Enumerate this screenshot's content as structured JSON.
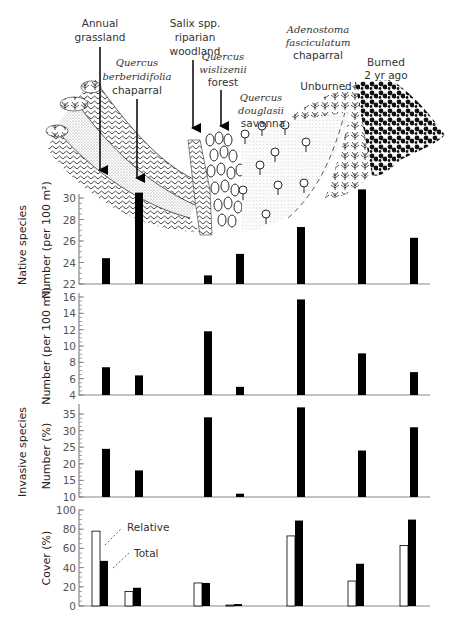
{
  "illustration": {
    "labels": [
      {
        "id": "annual-grassland",
        "lines": [
          "Annual",
          "grassland"
        ],
        "italic": [
          false,
          false
        ],
        "x": 98,
        "y": [
          27,
          41
        ],
        "arrow": {
          "x": 100,
          "y1": 47,
          "y2": 172
        }
      },
      {
        "id": "quercus-berberidifolia",
        "lines": [
          "Quercus",
          "berberidifolia",
          "chaparral"
        ],
        "italic": [
          true,
          true,
          false
        ],
        "x": 137,
        "y": [
          66,
          80,
          94
        ],
        "arrow": {
          "x": 137,
          "y1": 99,
          "y2": 182
        }
      },
      {
        "id": "salix-riparian",
        "lines": [
          "Salix spp.",
          "riparian",
          "woodland"
        ],
        "italic": [
          false,
          false,
          false
        ],
        "x": 195,
        "y": [
          27,
          41,
          55
        ],
        "arrow": {
          "x": 193,
          "y1": 60,
          "y2": 132
        }
      },
      {
        "id": "quercus-wislizenii",
        "lines": [
          "Quercus",
          "wislizenii",
          "forest"
        ],
        "italic": [
          true,
          true,
          false
        ],
        "x": 221,
        "y": [
          60,
          73,
          86
        ],
        "arrow": {
          "x": 221,
          "y1": 90,
          "y2": 130
        }
      },
      {
        "id": "quercus-douglasii",
        "lines": [
          "Quercus",
          "douglasii",
          "savanna"
        ],
        "italic": [
          true,
          true,
          false
        ],
        "x": 258,
        "y": [
          101,
          114,
          127
        ]
      },
      {
        "id": "adenostoma",
        "lines": [
          "Adenostoma",
          "fasciculatum",
          "chaparral"
        ],
        "italic": [
          true,
          true,
          false
        ],
        "x": 318,
        "y": [
          33,
          46,
          59
        ]
      },
      {
        "id": "unburned",
        "lines": [
          "Unburned"
        ],
        "italic": [
          false
        ],
        "x": 326,
        "y": [
          90
        ]
      },
      {
        "id": "burned",
        "lines": [
          "Burned",
          "2 yr ago"
        ],
        "italic": [
          false,
          false
        ],
        "x": 366,
        "y": [
          66,
          79
        ]
      }
    ]
  },
  "side_labels": {
    "native": "Native species",
    "invasive": "Invasive species"
  },
  "chart_data": [
    {
      "type": "bar",
      "group": "Native species",
      "title": "",
      "ylabel": "Number (per 100 m²)",
      "ylim": [
        22,
        31
      ],
      "yticks": [
        22,
        24,
        26,
        28,
        30
      ],
      "categories": [
        "Annual grassland",
        "Quercus berberidifolia chaparral",
        "Salix spp. riparian woodland",
        "Quercus wislizenii forest",
        "Quercus douglasii savanna",
        "Adenostoma fasciculatum chaparral (unburned)",
        "Adenostoma fasciculatum chaparral (burned 2 yr ago)"
      ],
      "values": [
        24.4,
        30.5,
        22.8,
        24.8,
        27.3,
        30.8,
        26.3
      ]
    },
    {
      "type": "bar",
      "group": "Invasive species",
      "title": "",
      "ylabel": "Number (per 100 m²)",
      "ylim": [
        4,
        16.5
      ],
      "yticks": [
        4,
        6,
        8,
        10,
        12,
        14,
        16
      ],
      "categories": [
        "Annual grassland",
        "Quercus berberidifolia chaparral",
        "Salix spp. riparian woodland",
        "Quercus wislizenii forest",
        "Quercus douglasii savanna",
        "Adenostoma fasciculatum chaparral (unburned)",
        "Adenostoma fasciculatum chaparral (burned 2 yr ago)"
      ],
      "values": [
        7.4,
        6.4,
        11.8,
        5.0,
        15.7,
        9.1,
        6.8
      ]
    },
    {
      "type": "bar",
      "group": "Invasive species",
      "title": "",
      "ylabel": "Number (%)",
      "ylim": [
        10,
        37.5
      ],
      "yticks": [
        10,
        15,
        20,
        25,
        30,
        35
      ],
      "categories": [
        "Annual grassland",
        "Quercus berberidifolia chaparral",
        "Salix spp. riparian woodland",
        "Quercus wislizenii forest",
        "Quercus douglasii savanna",
        "Adenostoma fasciculatum chaparral (unburned)",
        "Adenostoma fasciculatum chaparral (burned 2 yr ago)"
      ],
      "values": [
        24.5,
        18.0,
        34.0,
        11.0,
        37.0,
        24.0,
        31.0
      ]
    },
    {
      "type": "bar",
      "group": "Invasive species",
      "title": "",
      "ylabel": "Cover (%)",
      "ylim": [
        0,
        100
      ],
      "yticks": [
        0,
        20,
        40,
        60,
        80,
        100
      ],
      "categories": [
        "Annual grassland",
        "Quercus berberidifolia chaparral",
        "Salix spp. riparian woodland",
        "Quercus wislizenii forest",
        "Quercus douglasii savanna",
        "Adenostoma fasciculatum chaparral (unburned)",
        "Adenostoma fasciculatum chaparral (burned 2 yr ago)"
      ],
      "series": [
        {
          "name": "Relative",
          "fill": "#ffffff",
          "values": [
            78,
            15,
            24,
            1,
            73,
            26,
            63
          ]
        },
        {
          "name": "Total",
          "fill": "#000000",
          "values": [
            47,
            19,
            24,
            2,
            89,
            44,
            90
          ]
        }
      ],
      "annotations": [
        "Relative",
        "Total"
      ]
    }
  ]
}
